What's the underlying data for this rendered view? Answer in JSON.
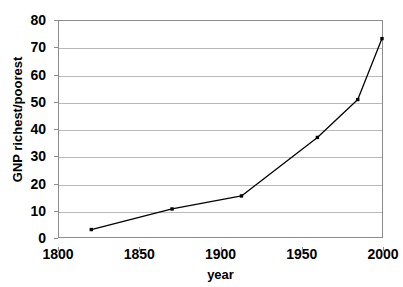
{
  "chart_data": {
    "type": "line",
    "title": "",
    "xlabel": "year",
    "ylabel": "GNP richest/poorest",
    "xlim": [
      1800,
      2000
    ],
    "ylim": [
      0,
      80
    ],
    "xticks": [
      "1800",
      "1850",
      "1900",
      "1950",
      "2000"
    ],
    "yticks": [
      "0",
      "10",
      "20",
      "30",
      "40",
      "50",
      "60",
      "70",
      "80"
    ],
    "grid": "horizontal",
    "legend": "none",
    "marker": "square",
    "series": [
      {
        "name": "GNP richest/poorest",
        "color": "#000000",
        "x": [
          1820,
          1870,
          1913,
          1960,
          1985,
          2000
        ],
        "values": [
          3,
          10.6,
          15.4,
          37,
          51,
          73.5
        ]
      }
    ]
  },
  "axes": {
    "y_title": "GNP richest/poorest",
    "x_title": "year",
    "y_ticks": [
      "80",
      "70",
      "60",
      "50",
      "40",
      "30",
      "20",
      "10",
      "0"
    ],
    "x_ticks": [
      "1800",
      "1850",
      "1900",
      "1950",
      "2000"
    ]
  },
  "colors": {
    "series": "#000000",
    "gridline": "#b9b9b9",
    "axis": "#8c8c8c",
    "background": "#ffffff"
  }
}
